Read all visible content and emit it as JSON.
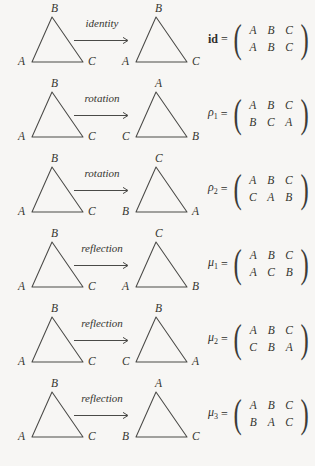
{
  "figure": {
    "vertex_labels_source": {
      "apex": "B",
      "bottom_left": "A",
      "bottom_right": "C"
    },
    "matrix_top_row": [
      "A",
      "B",
      "C"
    ]
  },
  "rows": [
    {
      "operation": "identity",
      "name": "id",
      "name_style": "bold",
      "subscript": "",
      "source": {
        "apex": "B",
        "bottom_left": "A",
        "bottom_right": "C"
      },
      "target": {
        "apex": "B",
        "bottom_left": "A",
        "bottom_right": "C"
      },
      "matrix": {
        "top": [
          "A",
          "B",
          "C"
        ],
        "bottom": [
          "A",
          "B",
          "C"
        ]
      }
    },
    {
      "operation": "rotation",
      "name": "ρ",
      "name_style": "greek",
      "subscript": "1",
      "source": {
        "apex": "B",
        "bottom_left": "A",
        "bottom_right": "C"
      },
      "target": {
        "apex": "A",
        "bottom_left": "C",
        "bottom_right": "B"
      },
      "matrix": {
        "top": [
          "A",
          "B",
          "C"
        ],
        "bottom": [
          "B",
          "C",
          "A"
        ]
      }
    },
    {
      "operation": "rotation",
      "name": "ρ",
      "name_style": "greek",
      "subscript": "2",
      "source": {
        "apex": "B",
        "bottom_left": "A",
        "bottom_right": "C"
      },
      "target": {
        "apex": "C",
        "bottom_left": "B",
        "bottom_right": "A"
      },
      "matrix": {
        "top": [
          "A",
          "B",
          "C"
        ],
        "bottom": [
          "C",
          "A",
          "B"
        ]
      }
    },
    {
      "operation": "reflection",
      "name": "μ",
      "name_style": "greek",
      "subscript": "1",
      "source": {
        "apex": "B",
        "bottom_left": "A",
        "bottom_right": "C"
      },
      "target": {
        "apex": "C",
        "bottom_left": "A",
        "bottom_right": "B"
      },
      "matrix": {
        "top": [
          "A",
          "B",
          "C"
        ],
        "bottom": [
          "A",
          "C",
          "B"
        ]
      }
    },
    {
      "operation": "reflection",
      "name": "μ",
      "name_style": "greek",
      "subscript": "2",
      "source": {
        "apex": "B",
        "bottom_left": "A",
        "bottom_right": "C"
      },
      "target": {
        "apex": "B",
        "bottom_left": "C",
        "bottom_right": "A"
      },
      "matrix": {
        "top": [
          "A",
          "B",
          "C"
        ],
        "bottom": [
          "C",
          "B",
          "A"
        ]
      }
    },
    {
      "operation": "reflection",
      "name": "μ",
      "name_style": "greek",
      "subscript": "3",
      "source": {
        "apex": "B",
        "bottom_left": "A",
        "bottom_right": "C"
      },
      "target": {
        "apex": "A",
        "bottom_left": "B",
        "bottom_right": "C"
      },
      "matrix": {
        "top": [
          "A",
          "B",
          "C"
        ],
        "bottom": [
          "B",
          "A",
          "C"
        ]
      }
    }
  ],
  "equals_sign": "=",
  "colors": {
    "ink": "#35352f",
    "stroke": "#4a4a47",
    "background": "#f7f6f4"
  }
}
